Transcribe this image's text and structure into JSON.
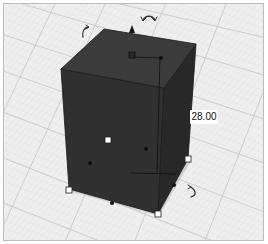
{
  "viewport": {
    "type": "3d-workplane",
    "grid_color": "#c8c8c8",
    "plane_color": "#eeeeee"
  },
  "shape": {
    "name": "box",
    "fill_top": "#3a3a3a",
    "fill_front": "#2f2f2f",
    "fill_side": "#282828"
  },
  "dimension": {
    "height_value": "28.00"
  },
  "icons": {
    "rotate_top": "rotate-arrow",
    "rotate_left": "rotate-arrow",
    "rotate_right": "rotate-arrow",
    "lift_handle": "cone-arrow-up"
  }
}
